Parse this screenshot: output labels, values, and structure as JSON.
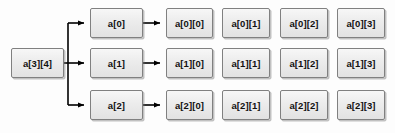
{
  "diagram": {
    "background_color": "#fdfdfd",
    "node_fill_color": "#ececec",
    "node_border_color": "#808080",
    "connector_color": "#000000",
    "root": {
      "label": "a[3][4]"
    },
    "rows": [
      {
        "pointer": "a[0]",
        "cells": [
          "a[0][0]",
          "a[0][1]",
          "a[0][2]",
          "a[0][3]"
        ]
      },
      {
        "pointer": "a[1]",
        "cells": [
          "a[1][0]",
          "a[1][1]",
          "a[1][2]",
          "a[1][3]"
        ]
      },
      {
        "pointer": "a[2]",
        "cells": [
          "a[2][0]",
          "a[2][1]",
          "a[2][2]",
          "a[2][3]"
        ]
      }
    ]
  }
}
